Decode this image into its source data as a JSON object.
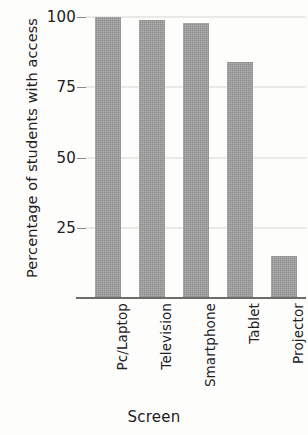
{
  "chart_data": {
    "type": "bar",
    "title": "",
    "xlabel": "Screen",
    "ylabel": "Percentage of students with access",
    "categories": [
      "Pc/Laptop",
      "Television",
      "Smartphone",
      "Tablet",
      "Projector"
    ],
    "values": [
      100,
      99,
      98,
      84,
      15
    ],
    "ylim": [
      0,
      100
    ],
    "yticks": [
      25,
      50,
      75,
      100
    ],
    "ytick_labels": [
      "25",
      "50",
      "75",
      "100"
    ],
    "grid": true,
    "legend": "none",
    "bar_color": "#9c9c9c",
    "axis_color": "#6f6c68",
    "grid_color": "#d9d6d0",
    "text_color": "#23201e",
    "background": "#fdfdfc"
  }
}
